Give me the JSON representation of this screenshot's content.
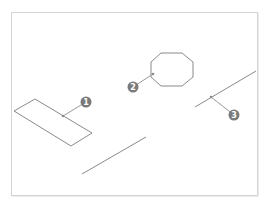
{
  "diagram": {
    "frame_color": "#d4d4d4",
    "stroke_color": "#8a8a8a",
    "badge_color": "#7a7a7a",
    "objects": [
      {
        "name": "parallelogram",
        "points": "14,111 35,99 92,133 71,146"
      },
      {
        "name": "octagon",
        "points": "161,53 182,53 193,62 193,77 182,86 161,86 151,77 151,62"
      },
      {
        "name": "line-middle",
        "x1": 82,
        "y1": 174,
        "x2": 146,
        "y2": 137
      },
      {
        "name": "line-right",
        "x1": 195,
        "y1": 107,
        "x2": 256,
        "y2": 71
      }
    ],
    "callouts": [
      {
        "label": "1",
        "cx": 86,
        "cy": 102,
        "px": 63,
        "py": 116
      },
      {
        "label": "2",
        "cx": 133,
        "cy": 87,
        "px": 153,
        "py": 74
      },
      {
        "label": "3",
        "cx": 234,
        "cy": 115,
        "px": 211,
        "py": 97
      }
    ]
  }
}
